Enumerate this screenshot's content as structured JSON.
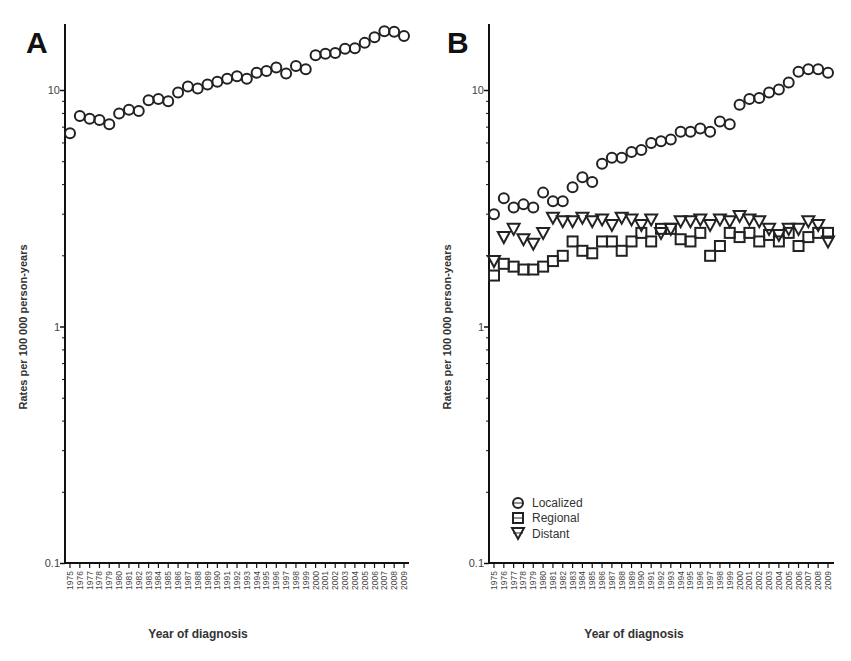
{
  "chart_data": [
    {
      "panel": "A",
      "type": "scatter",
      "title": "",
      "xlabel": "Year of diagnosis",
      "ylabel": "Rates per 100 000 person-years",
      "yscale": "log",
      "ylim": [
        0.1,
        20
      ],
      "yticks": [
        "0.1",
        "1",
        "10"
      ],
      "grid": false,
      "x": [
        1975,
        1976,
        1977,
        1978,
        1979,
        1980,
        1981,
        1982,
        1983,
        1984,
        1985,
        1986,
        1987,
        1988,
        1989,
        1990,
        1991,
        1992,
        1993,
        1994,
        1995,
        1996,
        1997,
        1998,
        1999,
        2000,
        2001,
        2002,
        2003,
        2004,
        2005,
        2006,
        2007,
        2008,
        2009
      ],
      "series": [
        {
          "name": "All stages",
          "marker": "circle",
          "values": [
            6.6,
            7.8,
            7.6,
            7.5,
            7.2,
            8.0,
            8.3,
            8.2,
            9.1,
            9.2,
            9.0,
            9.8,
            10.4,
            10.2,
            10.6,
            10.9,
            11.2,
            11.5,
            11.2,
            11.9,
            12.1,
            12.5,
            11.8,
            12.7,
            12.3,
            14.1,
            14.3,
            14.4,
            15.0,
            15.1,
            15.9,
            16.8,
            17.8,
            17.7,
            17.0
          ]
        }
      ]
    },
    {
      "panel": "B",
      "type": "scatter",
      "title": "",
      "xlabel": "Year of diagnosis",
      "ylabel": "Rates per 100 000 person-years",
      "yscale": "log",
      "ylim": [
        0.1,
        20
      ],
      "yticks": [
        "0.1",
        "1",
        "10"
      ],
      "grid": false,
      "legend_position": "lower-left",
      "x": [
        1975,
        1976,
        1977,
        1978,
        1979,
        1980,
        1981,
        1982,
        1983,
        1984,
        1985,
        1986,
        1987,
        1988,
        1989,
        1990,
        1991,
        1992,
        1993,
        1994,
        1995,
        1996,
        1997,
        1998,
        1999,
        2000,
        2001,
        2002,
        2003,
        2004,
        2005,
        2006,
        2007,
        2008,
        2009
      ],
      "series": [
        {
          "name": "Localized",
          "marker": "circle",
          "values": [
            3.0,
            3.5,
            3.2,
            3.3,
            3.2,
            3.7,
            3.4,
            3.4,
            3.9,
            4.3,
            4.1,
            4.9,
            5.2,
            5.2,
            5.5,
            5.6,
            6.0,
            6.1,
            6.2,
            6.7,
            6.7,
            6.9,
            6.7,
            7.4,
            7.2,
            8.7,
            9.2,
            9.3,
            9.8,
            10.1,
            10.8,
            12.0,
            12.3,
            12.3,
            11.9
          ]
        },
        {
          "name": "Regional",
          "marker": "square",
          "values": [
            1.65,
            1.85,
            1.8,
            1.75,
            1.75,
            1.8,
            1.9,
            2.0,
            2.3,
            2.1,
            2.05,
            2.3,
            2.3,
            2.1,
            2.3,
            2.5,
            2.3,
            2.6,
            2.6,
            2.35,
            2.3,
            2.5,
            2.0,
            2.2,
            2.5,
            2.4,
            2.5,
            2.3,
            2.45,
            2.3,
            2.5,
            2.2,
            2.4,
            2.5,
            2.5
          ]
        },
        {
          "name": "Distant",
          "marker": "triangle-down",
          "values": [
            1.9,
            2.4,
            2.6,
            2.35,
            2.25,
            2.5,
            2.9,
            2.8,
            2.8,
            2.9,
            2.8,
            2.85,
            2.7,
            2.9,
            2.85,
            2.7,
            2.85,
            2.5,
            2.6,
            2.8,
            2.8,
            2.85,
            2.7,
            2.85,
            2.8,
            2.95,
            2.85,
            2.8,
            2.6,
            2.45,
            2.6,
            2.6,
            2.8,
            2.7,
            2.3
          ]
        }
      ]
    }
  ],
  "panels": {
    "a": {
      "letter": "A"
    },
    "b": {
      "letter": "B"
    }
  },
  "legend": {
    "items": [
      {
        "label": "Localized"
      },
      {
        "label": "Regional"
      },
      {
        "label": "Distant"
      }
    ]
  },
  "axes": {
    "ylabel": "Rates per 100 000 person-years",
    "xlabel": "Year of diagnosis",
    "yticks": [
      "0.1",
      "1",
      "10"
    ]
  }
}
